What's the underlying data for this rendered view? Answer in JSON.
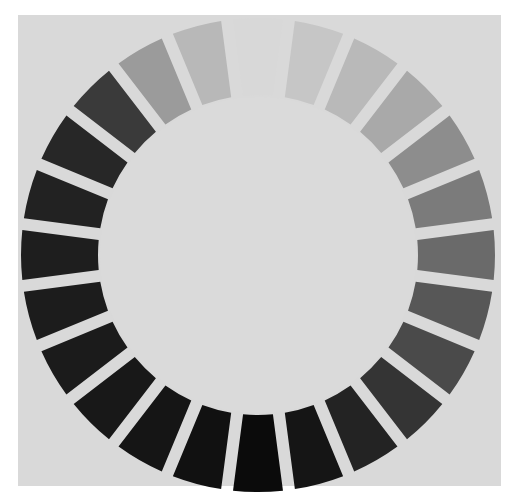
{
  "figure": {
    "background_color": "#d9d9d9",
    "center_color": "#dadada",
    "ring": {
      "segment_count": 24,
      "center": [
        258,
        255
      ],
      "outer_radius": 237,
      "inner_radius": 160,
      "gap_degrees": 2.6,
      "start_angle_deg": 0,
      "segments": [
        {
          "index": 0,
          "color": "#d8d8d8"
        },
        {
          "index": 1,
          "color": "#c6c6c6"
        },
        {
          "index": 2,
          "color": "#b9b9b9"
        },
        {
          "index": 3,
          "color": "#a9a9a9"
        },
        {
          "index": 4,
          "color": "#8d8d8d"
        },
        {
          "index": 5,
          "color": "#7b7b7b"
        },
        {
          "index": 6,
          "color": "#6a6a6a"
        },
        {
          "index": 7,
          "color": "#575757"
        },
        {
          "index": 8,
          "color": "#4a4a4a"
        },
        {
          "index": 9,
          "color": "#343434"
        },
        {
          "index": 10,
          "color": "#232323"
        },
        {
          "index": 11,
          "color": "#151515"
        },
        {
          "index": 12,
          "color": "#0b0b0b"
        },
        {
          "index": 13,
          "color": "#111111"
        },
        {
          "index": 14,
          "color": "#151515"
        },
        {
          "index": 15,
          "color": "#181818"
        },
        {
          "index": 16,
          "color": "#1b1b1b"
        },
        {
          "index": 17,
          "color": "#1c1c1c"
        },
        {
          "index": 18,
          "color": "#1e1e1e"
        },
        {
          "index": 19,
          "color": "#222222"
        },
        {
          "index": 20,
          "color": "#272727"
        },
        {
          "index": 21,
          "color": "#3a3a3a"
        },
        {
          "index": 22,
          "color": "#9b9b9b"
        },
        {
          "index": 23,
          "color": "#b8b8b8"
        }
      ]
    }
  }
}
